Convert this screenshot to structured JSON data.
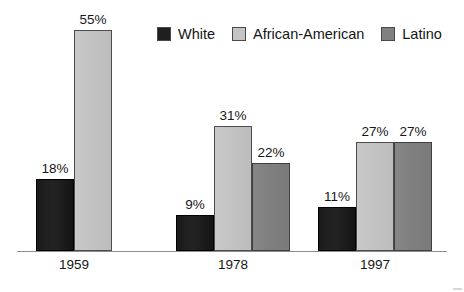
{
  "chart_data": {
    "type": "bar",
    "title": "",
    "subtitle": "",
    "xlabel": "",
    "ylabel": "",
    "ylim": [
      0,
      60
    ],
    "grid": false,
    "legend_position": "top-right",
    "value_suffix": "%",
    "categories": [
      "1959",
      "1978",
      "1997"
    ],
    "series": [
      {
        "name": "White",
        "color": "#1f1f1f",
        "values": [
          18,
          9,
          11
        ],
        "labels": [
          "18%",
          "9%",
          "11%"
        ]
      },
      {
        "name": "African-American",
        "color": "#c4c4c4",
        "values": [
          55,
          31,
          27
        ],
        "labels": [
          "55%",
          "31%",
          "27%"
        ]
      },
      {
        "name": "Latino",
        "color": "#808080",
        "values": [
          null,
          22,
          27
        ],
        "labels": [
          "",
          "22%",
          "27%"
        ]
      }
    ]
  },
  "legend": {
    "entries": [
      {
        "label": "White",
        "color": "#1f1f1f"
      },
      {
        "label": "African-American",
        "color": "#c4c4c4"
      },
      {
        "label": "Latino",
        "color": "#808080"
      }
    ]
  },
  "axis": {
    "category_labels": [
      "1959",
      "1978",
      "1997"
    ],
    "baseline_color": "#8d8d8d"
  },
  "groups": [
    {
      "label": "1959",
      "bars": [
        {
          "series": "White",
          "value": 18,
          "label": "18%",
          "series_class": "white-series"
        },
        {
          "series": "African-American",
          "value": 55,
          "label": "55%",
          "series_class": "aa-series"
        }
      ]
    },
    {
      "label": "1978",
      "bars": [
        {
          "series": "White",
          "value": 9,
          "label": "9%",
          "series_class": "white-series"
        },
        {
          "series": "African-American",
          "value": 31,
          "label": "31%",
          "series_class": "aa-series"
        },
        {
          "series": "Latino",
          "value": 22,
          "label": "22%",
          "series_class": "latino-series"
        }
      ]
    },
    {
      "label": "1997",
      "bars": [
        {
          "series": "White",
          "value": 11,
          "label": "11%",
          "series_class": "white-series"
        },
        {
          "series": "African-American",
          "value": 27,
          "label": "27%",
          "series_class": "aa-series"
        },
        {
          "series": "Latino",
          "value": 27,
          "label": "27%",
          "series_class": "latino-series"
        }
      ]
    }
  ],
  "render": {
    "pixels_per_unit": 4.02,
    "bar_width": 38,
    "group_left_offsets": [
      36,
      176,
      318
    ]
  }
}
